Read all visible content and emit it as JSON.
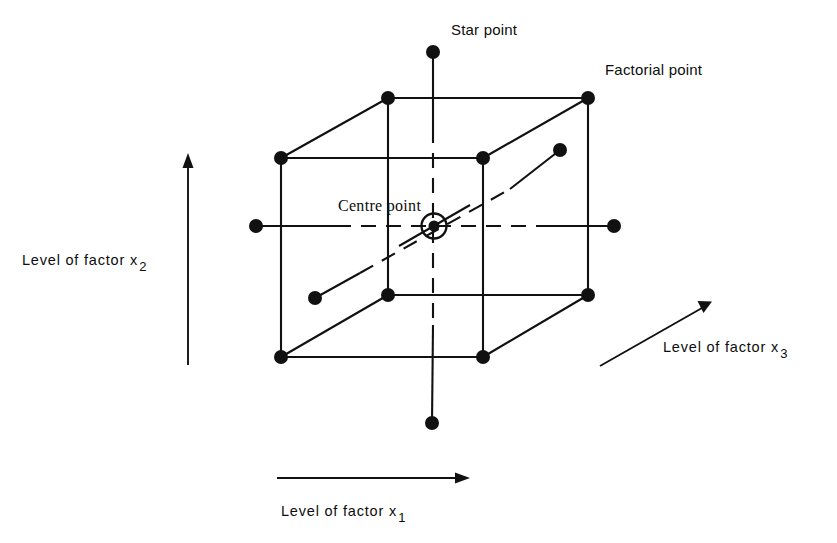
{
  "figure": {
    "type": "central-composite-design-diagram",
    "background": "#ffffff",
    "ink_color": "#111111",
    "labels": {
      "star_point": "Star point",
      "factorial_point": "Factorial point",
      "centre_point": "Centre  point",
      "axis_x1_prefix": "Level of factor",
      "axis_x1_var": "x",
      "axis_x1_sub": "1",
      "axis_x2_prefix": "Level of factor",
      "axis_x2_var": "x",
      "axis_x2_sub": "2",
      "axis_x3_prefix": "Level of factor",
      "axis_x3_var": "x",
      "axis_x3_sub": "3"
    },
    "geometry": {
      "cube": {
        "front_top_left": [
          281,
          158
        ],
        "front_top_right": [
          483,
          158
        ],
        "front_bottom_left": [
          281,
          357
        ],
        "front_bottom_right": [
          483,
          357
        ],
        "back_top_left": [
          388,
          98
        ],
        "back_top_right": [
          588,
          98
        ],
        "back_bottom_left": [
          388,
          295
        ],
        "back_bottom_right": [
          588,
          295
        ]
      },
      "centre_point": [
        434,
        226
      ],
      "star_points": {
        "top": [
          433,
          52
        ],
        "bottom": [
          432,
          423
        ],
        "left": [
          256,
          226
        ],
        "right": [
          614,
          226
        ],
        "front_diagonal": [
          315,
          298
        ],
        "back_diagonal": [
          560,
          150
        ]
      },
      "axis_arrows": {
        "x1": {
          "from": [
            277,
            478
          ],
          "to": [
            460,
            478
          ]
        },
        "x2": {
          "from": [
            188,
            365
          ],
          "to": [
            188,
            160
          ]
        },
        "x3": {
          "from": [
            600,
            366
          ],
          "to": [
            709,
            304
          ]
        }
      }
    }
  }
}
